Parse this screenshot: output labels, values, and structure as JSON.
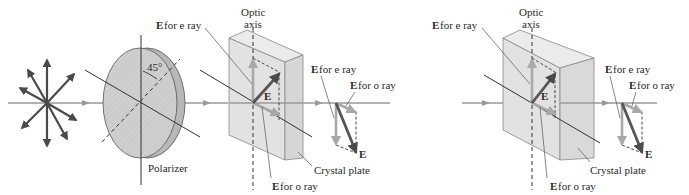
{
  "colors": {
    "beam": "#9a9a9a",
    "vector_dark": "#4a4a4a",
    "vector_light": "#a8a8a8",
    "polarizer_face": "#cfcfcf",
    "polarizer_edge": "#b5b5b5",
    "crystal_face": "#e2e2e2",
    "crystal_side": "#d6d6d6",
    "crystal_top": "#ebebeb",
    "line": "#333333",
    "text": "#2a2a2a"
  },
  "left_panel": {
    "polarizer_label": "Polarizer",
    "angle_label": "45°",
    "optic_axis_label_line1": "Optic",
    "optic_axis_label_line2": "axis",
    "e_for_e_ray_top": {
      "bold": "E",
      "rest": " for e ray"
    },
    "e_vector_label": "E",
    "e_for_o_ray_bottom": {
      "bold": "E",
      "rest": " for o ray"
    },
    "crystal_plate_label": "Crystal plate",
    "out_e_for_e_ray": {
      "bold": "E",
      "rest": " for e ray"
    },
    "out_e_for_o_ray": {
      "bold": "E",
      "rest": " for o ray"
    },
    "out_e_label": "E"
  },
  "right_panel": {
    "e_for_e_ray_top": {
      "bold": "E",
      "rest": " for e ray"
    },
    "optic_axis_label_line1": "Optic",
    "optic_axis_label_line2": "axis",
    "e_vector_label": "E",
    "out_e_for_e_ray": {
      "bold": "E",
      "rest": " for e ray"
    },
    "out_e_for_o_ray": {
      "bold": "E",
      "rest": " for o ray"
    },
    "out_e_label": "E",
    "crystal_plate_label": "Crystal plate",
    "e_for_o_ray_bottom": {
      "bold": "E",
      "rest": " for o ray"
    }
  }
}
